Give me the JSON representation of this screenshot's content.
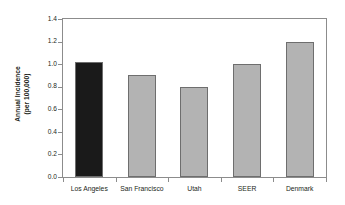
{
  "chart_data": {
    "type": "bar",
    "title": "",
    "xlabel": "",
    "ylabel": "Annual Incidence (per 100,000)",
    "ylabel_lines": [
      "Annual Incidence",
      "(per 100,000)"
    ],
    "categories": [
      "Los Angeles",
      "San Francisco",
      "Utah",
      "SEER",
      "Denmark"
    ],
    "values": [
      1.02,
      0.9,
      0.8,
      1.0,
      1.2
    ],
    "ylim": [
      0.0,
      1.4
    ],
    "ytick_values": [
      0.0,
      0.2,
      0.4,
      0.6,
      0.8,
      1.0,
      1.2,
      1.4
    ],
    "ytick_labels": [
      "0.0",
      "0.2",
      "0.4",
      "0.6",
      "0.8",
      "1.0",
      "1.2",
      "1.4"
    ],
    "grid": false,
    "legend": "none",
    "bar_colors": [
      "#1a1a1a",
      "#b3b3b3",
      "#b3b3b3",
      "#b3b3b3",
      "#b3b3b3"
    ],
    "bar_edge_color": "#6e6e6e",
    "highlight_category": "Los Angeles",
    "plot_background": "#ffffff",
    "axis_color": "#8c8c8c"
  }
}
